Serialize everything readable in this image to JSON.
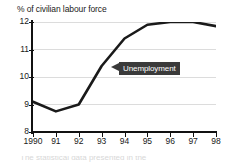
{
  "chart_data": {
    "type": "line",
    "title": "% of civilian labour force",
    "xlabel": "",
    "ylabel": "",
    "x": [
      "1990",
      "91",
      "92",
      "93",
      "94",
      "95",
      "96",
      "97",
      "98"
    ],
    "categories": [
      "1990",
      "91",
      "92",
      "93",
      "94",
      "95",
      "96",
      "97",
      "98"
    ],
    "series": [
      {
        "name": "Unemployment",
        "values": [
          9.1,
          8.75,
          9.0,
          10.4,
          11.4,
          11.9,
          12.0,
          12.0,
          11.85
        ]
      }
    ],
    "ylim": [
      8,
      12
    ],
    "yticks": [
      8,
      9,
      10,
      11,
      12
    ],
    "ytick_labels": [
      "8",
      "9",
      "10",
      "11",
      "12"
    ],
    "xtick_labels": [
      "1990",
      "91",
      "92",
      "93",
      "94",
      "95",
      "96",
      "97",
      "98"
    ],
    "grid": true,
    "grid_axis": "y",
    "legend": "none",
    "annotations": [
      {
        "text": "Unemployment",
        "style": "dark-callout-box-with-left-arrow",
        "points_to_year": "93",
        "points_to_value": 10.4
      }
    ],
    "colors": {
      "line": "#1a1a1a",
      "grid": "#dcdcdc",
      "axis": "#111111",
      "annotation_background": "#3a3a3a",
      "annotation_text": "#ffffff",
      "background": "#ffffff"
    }
  },
  "caption": {
    "clipped_text": "The statistical data presented in the"
  }
}
